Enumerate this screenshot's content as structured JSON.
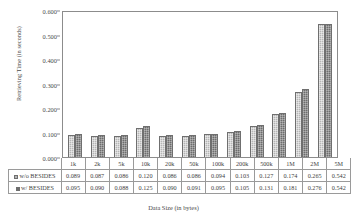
{
  "chart_data": {
    "type": "bar",
    "title": "",
    "xlabel": "Data Size (in bytes)",
    "ylabel": "Retrieving Time (in seconds)",
    "categories": [
      "1k",
      "2k",
      "5k",
      "10k",
      "20k",
      "50k",
      "100k",
      "200k",
      "500k",
      "1M",
      "2M",
      "5M"
    ],
    "series": [
      {
        "name": "w/o BESIDES",
        "color": "#b5b5b5",
        "values": [
          0.089,
          0.087,
          0.086,
          0.12,
          0.086,
          0.086,
          0.094,
          0.103,
          0.127,
          0.174,
          0.265,
          0.542
        ],
        "labels": [
          "0.089",
          "0.087",
          "0.086",
          "0.120",
          "0.086",
          "0.086",
          "0.094",
          "0.103",
          "0.127",
          "0.174",
          "0.265",
          "0.542"
        ]
      },
      {
        "name": "w/ BESIDES",
        "color": "#6d6d6d",
        "values": [
          0.095,
          0.09,
          0.088,
          0.125,
          0.09,
          0.091,
          0.095,
          0.105,
          0.131,
          0.181,
          0.276,
          0.542
        ],
        "labels": [
          "0.095",
          "0.090",
          "0.088",
          "0.125",
          "0.090",
          "0.091",
          "0.095",
          "0.105",
          "0.131",
          "0.181",
          "0.276",
          "0.542"
        ]
      }
    ],
    "ylim": [
      0,
      0.6
    ],
    "yticks": [
      "0.000",
      "0.100",
      "0.200",
      "0.300",
      "0.400",
      "0.500",
      "0.600"
    ],
    "ytick_values": [
      0.0,
      0.1,
      0.2,
      0.3,
      0.4,
      0.5,
      0.6
    ],
    "grid": false,
    "legend_position": "data-table-left",
    "data_table": true
  }
}
